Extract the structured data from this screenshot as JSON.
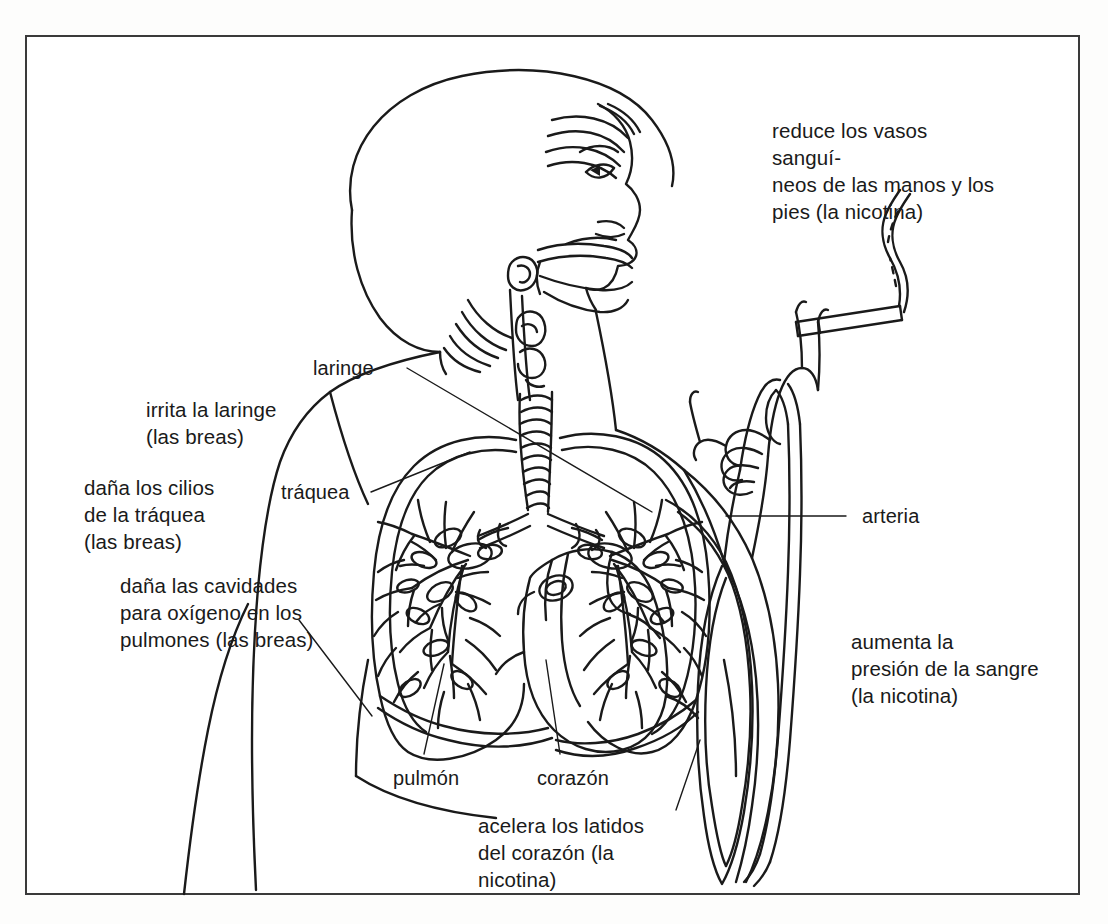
{
  "diagram": {
    "language": "es",
    "line_color": "#1a1a1a",
    "text_color": "#1a1a1a",
    "background_color": "#ffffff",
    "frame_color": "#3a3a3a"
  },
  "annotations": {
    "reduce_vasos": "reduce los vasos sanguí-\nneos de las manos y los\npies (la nicotina)",
    "irrita_laringe": "irrita la laringe\n(las breas)",
    "dana_cilios": "daña los cilios\nde la tráquea\n(las breas)",
    "dana_cavidades": "daña las cavidades\npara oxígeno en los\npulmones (las breas)",
    "aumenta_presion": "aumenta la\npresión de la sangre\n(la nicotina)",
    "acelera_latidos": "acelera los latidos\ndel corazón (la\nnicotina)"
  },
  "part_labels": {
    "laringe": "laringe",
    "traquea": "tráquea",
    "arteria": "arteria",
    "pulmon": "pulmón",
    "corazon": "corazón"
  },
  "illustration_parts": [
    "cabeza-de-perfil",
    "cabello-corto",
    "cavidad-nasal",
    "boca",
    "laringe",
    "traquea",
    "pulmon-izquierdo",
    "pulmon-derecho",
    "arbol-bronquial",
    "corazon",
    "arteria",
    "brazo",
    "mano",
    "cigarrillo",
    "humo"
  ]
}
